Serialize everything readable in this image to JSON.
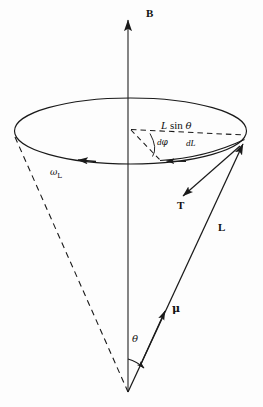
{
  "figure": {
    "background_color": "#fdfdfd",
    "stroke_color": "#1a1a1a"
  },
  "labels": {
    "field_vector": "B",
    "angular_momentum_vector": "L",
    "torque_vector": "T",
    "magnetic_moment_vector": "μ",
    "larmor_frequency": "ω",
    "larmor_frequency_subscript": "L",
    "cone_angle": "θ",
    "radius_label_L": "L",
    "radius_label_sin": "sin",
    "radius_label_theta": "θ",
    "angle_increment_d": "d",
    "angle_increment_phi": "φ",
    "momentum_increment_d": "d",
    "momentum_increment_L": "L"
  },
  "geometry": {
    "apex": {
      "x": 128,
      "y": 392
    },
    "axis_top": {
      "x": 128,
      "y": 13
    },
    "ellipse_center": {
      "x": 130.5,
      "y": 131
    },
    "ellipse_rx": 116,
    "ellipse_ry": 33,
    "L_tip": {
      "x": 245,
      "y": 141
    },
    "L_tail": {
      "x": 128,
      "y": 392
    },
    "mu_tip": {
      "x": 166,
      "y": 308
    },
    "T_tip": {
      "x": 181,
      "y": 198
    },
    "T_tail": {
      "x": 240,
      "y": 146
    },
    "dashed_left_edge": {
      "x": 15,
      "y": 137
    },
    "dL_arc_end": {
      "x": 159,
      "y": 159
    }
  },
  "icons": {
    "arrow_up": "arrowhead-up",
    "arrow_down": "arrowhead-down",
    "arrow_diagonal": "arrowhead-diagonal"
  }
}
